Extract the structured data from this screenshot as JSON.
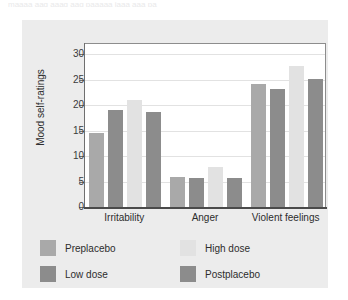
{
  "figure": {
    "top_clipped_text": "maaaa aag aaag aaq paaaaa jaaa aaa pa",
    "card_bg": "#ececec",
    "plot_bg": "#ffffff",
    "frame_color": "#8d8d8d",
    "grid_color": "#e2e2e2",
    "axis_color": "#4a4a4a",
    "text_color": "#2d2d2d"
  },
  "chart_data": {
    "type": "bar",
    "title": "",
    "xlabel": "",
    "ylabel": "Mood self-ratings",
    "categories": [
      "Irritability",
      "Anger",
      "Violent feelings"
    ],
    "ylim": [
      0,
      32
    ],
    "yticks": [
      0,
      5,
      10,
      15,
      20,
      25,
      30
    ],
    "ytick_labels": [
      "0",
      "5",
      "10",
      "15",
      "20",
      "25",
      "30"
    ],
    "grid": true,
    "legend_position": "below-plot",
    "series": [
      {
        "name": "Preplacebo",
        "color": "#a9a9a9",
        "values": [
          14.6,
          5.8,
          24.2
        ]
      },
      {
        "name": "Low dose",
        "color": "#8c8c8c",
        "values": [
          19.0,
          5.6,
          23.2
        ]
      },
      {
        "name": "High dose",
        "color": "#e2e2e2",
        "values": [
          21.0,
          7.8,
          27.6
        ]
      },
      {
        "name": "Postplacebo",
        "color": "#8c8c8c",
        "values": [
          18.7,
          5.6,
          25.2
        ]
      }
    ]
  },
  "legend": {
    "entries": [
      {
        "label": "Preplacebo",
        "color": "#a9a9a9"
      },
      {
        "label": "High dose",
        "color": "#e2e2e2"
      },
      {
        "label": "Low dose",
        "color": "#8c8c8c"
      },
      {
        "label": "Postplacebo",
        "color": "#8c8c8c"
      }
    ]
  }
}
